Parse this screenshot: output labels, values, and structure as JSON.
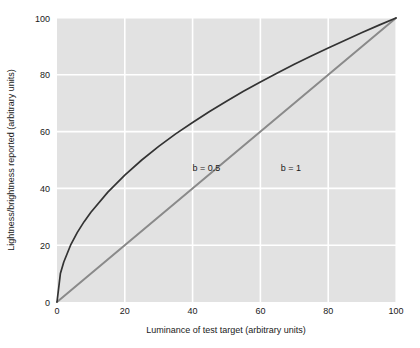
{
  "chart_data": {
    "type": "line",
    "title": "",
    "xlabel": "Luminance of test target (arbitrary units)",
    "ylabel": "Lightness/brightness reported (arbitrary units)",
    "xlim": [
      0,
      100
    ],
    "ylim": [
      0,
      100
    ],
    "xticks": [
      0,
      20,
      40,
      60,
      80,
      100
    ],
    "yticks": [
      0,
      20,
      40,
      60,
      80,
      100
    ],
    "xtick_labels": [
      "0",
      "20",
      "40",
      "60",
      "80",
      "100"
    ],
    "ytick_labels": [
      "0",
      "20",
      "40",
      "60",
      "80",
      "100"
    ],
    "grid": true,
    "legend_position": "inline-annotations",
    "plot_background": "#e2e2e2",
    "grid_color": "#ffffff",
    "series": [
      {
        "name": "b = 0.5",
        "label": "b = 0.5",
        "color": "#333333",
        "width": 1.7,
        "formula": "y = 100 * (x/100)^0.5",
        "label_x": 40,
        "label_y": 46,
        "x": [
          0,
          1,
          2,
          4,
          6,
          8,
          10,
          15,
          20,
          25,
          30,
          35,
          40,
          45,
          50,
          55,
          60,
          65,
          70,
          75,
          80,
          85,
          90,
          95,
          100
        ],
        "y": [
          0,
          10.0,
          14.1,
          20.0,
          24.5,
          28.3,
          31.6,
          38.7,
          44.7,
          50.0,
          54.8,
          59.2,
          63.2,
          67.1,
          70.7,
          74.2,
          77.5,
          80.6,
          83.7,
          86.6,
          89.4,
          92.2,
          94.9,
          97.5,
          100
        ]
      },
      {
        "name": "b = 1",
        "label": "b = 1",
        "color": "#8a8a8a",
        "width": 2.0,
        "formula": "y = x",
        "label_x": 66,
        "label_y": 46,
        "x": [
          0,
          100
        ],
        "y": [
          0,
          100
        ]
      }
    ]
  }
}
